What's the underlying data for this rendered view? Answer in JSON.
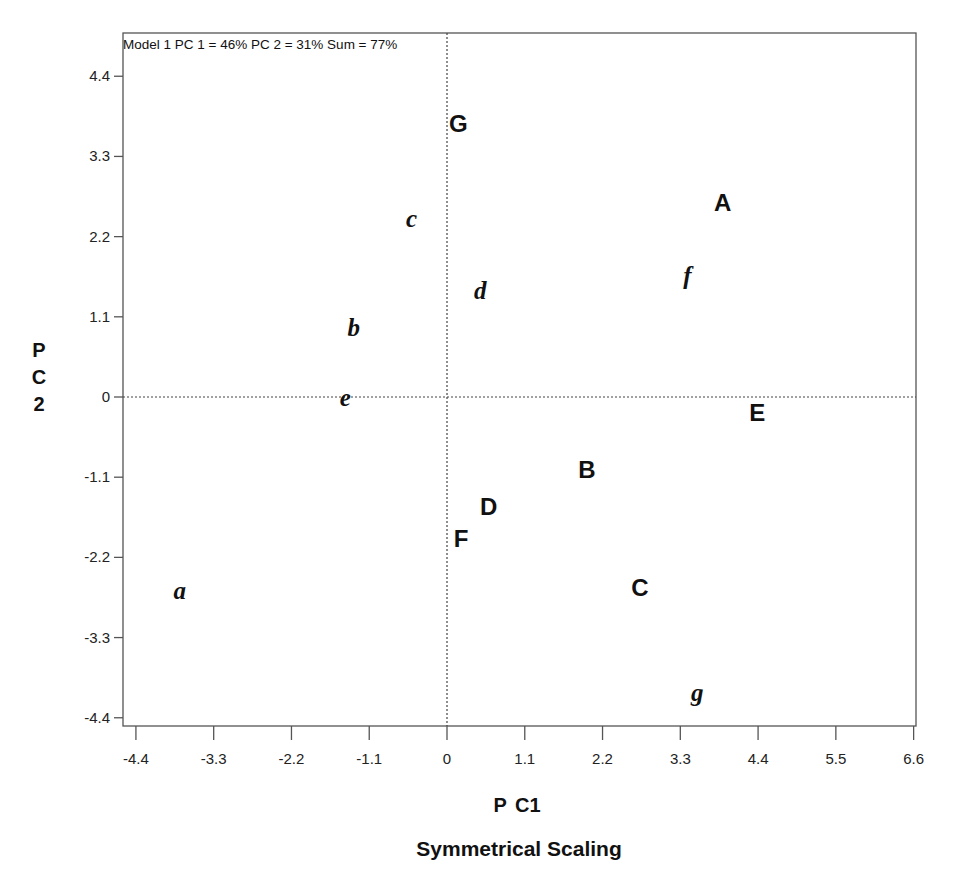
{
  "chart_data": {
    "type": "scatter",
    "title": "Model 1 PC 1 = 46% PC 2 = 31% Sum = 77%",
    "subtitle": "Symmetrical Scaling",
    "xlabel": "P C1",
    "ylabel": "P C 2",
    "ylabel_lines": [
      "P",
      "C",
      "2"
    ],
    "xlim": [
      -4.4,
      6.6
    ],
    "ylim": [
      -4.4,
      4.4
    ],
    "x_ticks": [
      "-4.4",
      "-3.3",
      "-2.2",
      "-1.1",
      "0",
      "1.1",
      "2.2",
      "3.3",
      "4.4",
      "5.5",
      "6.6"
    ],
    "y_ticks": [
      "4.4",
      "3.3",
      "2.2",
      "1.1",
      "0",
      "-1.1",
      "-2.2",
      "-3.3",
      "-4.4"
    ],
    "grid": false,
    "reference_lines": {
      "x0": "dotted",
      "y0": "dotted"
    },
    "legend": null,
    "series": [
      {
        "name": "Uppercase (bold sans)",
        "style": "upper",
        "points": [
          {
            "label": "A",
            "x": 3.9,
            "y": 2.67
          },
          {
            "label": "B",
            "x": 1.98,
            "y": -0.99
          },
          {
            "label": "C",
            "x": 2.73,
            "y": -2.6
          },
          {
            "label": "D",
            "x": 0.59,
            "y": -1.5
          },
          {
            "label": "E",
            "x": 4.39,
            "y": -0.2
          },
          {
            "label": "F",
            "x": 0.2,
            "y": -1.93
          },
          {
            "label": "G",
            "x": 0.16,
            "y": 3.76
          }
        ]
      },
      {
        "name": "Lowercase (italic serif)",
        "style": "lower",
        "points": [
          {
            "label": "a",
            "x": -3.78,
            "y": -2.65
          },
          {
            "label": "b",
            "x": -1.32,
            "y": 0.96
          },
          {
            "label": "c",
            "x": -0.5,
            "y": 2.46
          },
          {
            "label": "d",
            "x": 0.47,
            "y": 1.47
          },
          {
            "label": "e",
            "x": -1.44,
            "y": 0.0
          },
          {
            "label": "f",
            "x": 3.4,
            "y": 1.67
          },
          {
            "label": "g",
            "x": 3.54,
            "y": -4.05
          }
        ]
      }
    ]
  },
  "colors": {
    "background": "#ffffff",
    "frame": "#555555",
    "text": "#111111",
    "reference_line": "#444444"
  }
}
